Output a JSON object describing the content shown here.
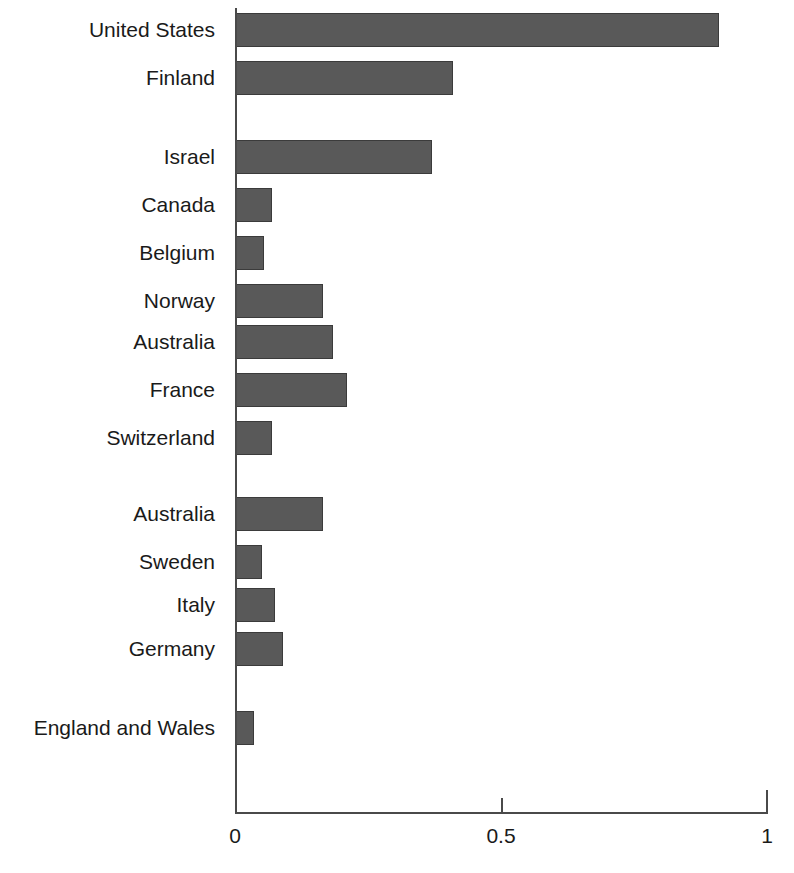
{
  "chart_data": {
    "type": "bar",
    "orientation": "horizontal",
    "title": "",
    "subtitle": "",
    "xlabel": "",
    "ylabel": "",
    "xlim": [
      0,
      1
    ],
    "ylim": null,
    "grid": false,
    "legend": null,
    "axis_ticks": [
      "0",
      "0.5",
      "1"
    ],
    "axis_tick_values": [
      0,
      0.5,
      1
    ],
    "bar_color": "#595959",
    "bar_edge_color": "#3b3b3b",
    "axis_color": "#4a4a4a",
    "background_color": "#ffffff",
    "categories": [
      "United States",
      "Finland",
      "Israel",
      "Canada",
      "Belgium",
      "Norway",
      "Australia",
      "France",
      "Switzerland",
      "Australia",
      "Sweden",
      "Italy",
      "Germany",
      "England and Wales"
    ],
    "values": [
      0.91,
      0.41,
      0.37,
      0.07,
      0.055,
      0.165,
      0.185,
      0.21,
      0.07,
      0.165,
      0.05,
      0.075,
      0.09,
      0.035
    ],
    "groups": [
      {
        "name": "group-1",
        "categories": [
          "United States",
          "Finland"
        ]
      },
      {
        "name": "group-2",
        "categories": [
          "Israel",
          "Canada",
          "Belgium",
          "Norway",
          "Australia",
          "France",
          "Switzerland"
        ]
      },
      {
        "name": "group-3",
        "categories": [
          "Australia",
          "Sweden",
          "Italy",
          "Germany"
        ]
      },
      {
        "name": "group-4",
        "categories": [
          "England and Wales"
        ]
      }
    ],
    "bars": [
      {
        "label": "United States",
        "value": 0.91,
        "top": 13,
        "height": 34
      },
      {
        "label": "Finland",
        "value": 0.41,
        "top": 61,
        "height": 34
      },
      {
        "label": "Israel",
        "value": 0.37,
        "top": 140,
        "height": 34
      },
      {
        "label": "Canada",
        "value": 0.07,
        "top": 188,
        "height": 34
      },
      {
        "label": "Belgium",
        "value": 0.055,
        "top": 236,
        "height": 34
      },
      {
        "label": "Norway",
        "value": 0.165,
        "top": 284,
        "height": 34
      },
      {
        "label": "Australia",
        "value": 0.185,
        "top": 325,
        "height": 34
      },
      {
        "label": "France",
        "value": 0.21,
        "top": 373,
        "height": 34
      },
      {
        "label": "Switzerland",
        "value": 0.07,
        "top": 421,
        "height": 34
      },
      {
        "label": "Australia",
        "value": 0.165,
        "top": 497,
        "height": 34
      },
      {
        "label": "Sweden",
        "value": 0.05,
        "top": 545,
        "height": 34
      },
      {
        "label": "Italy",
        "value": 0.075,
        "top": 588,
        "height": 34
      },
      {
        "label": "Germany",
        "value": 0.09,
        "top": 632,
        "height": 34
      },
      {
        "label": "England and Wales",
        "value": 0.035,
        "top": 711,
        "height": 34
      }
    ]
  }
}
